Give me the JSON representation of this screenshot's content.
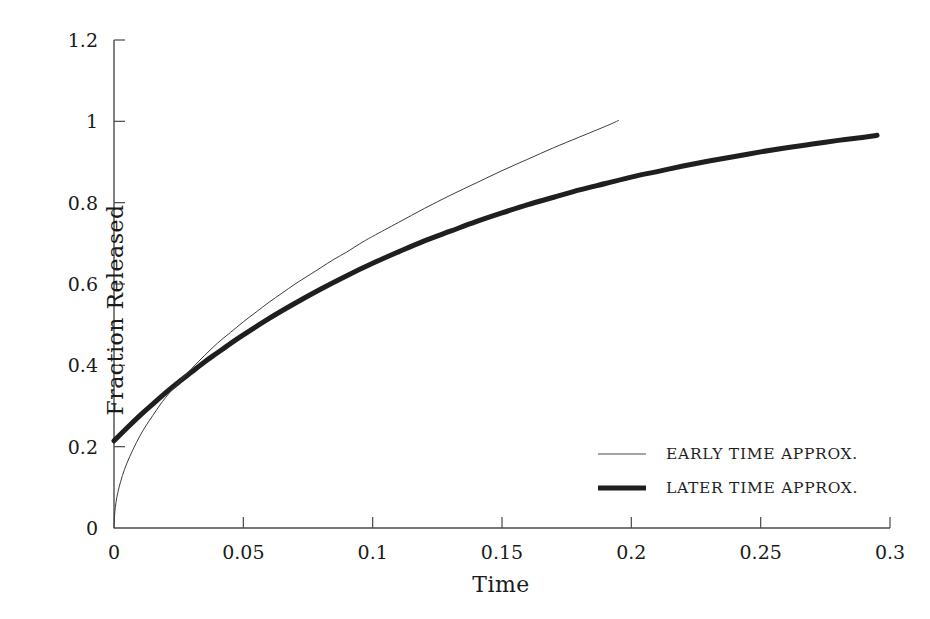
{
  "chart_data": {
    "type": "line",
    "title": "",
    "xlabel": "Time",
    "ylabel": "Fraction Released",
    "xlim": [
      0,
      0.3
    ],
    "ylim": [
      0,
      1.2
    ],
    "grid": false,
    "legend_position": "center-right",
    "x_ticks": [
      "0",
      "0.05",
      "0.1",
      "0.15",
      "0.2",
      "0.25",
      "0.3"
    ],
    "x_tick_values": [
      0,
      0.05,
      0.1,
      0.15,
      0.2,
      0.25,
      0.3
    ],
    "y_ticks": [
      "0",
      "0.2",
      "0.4",
      "0.6",
      "0.8",
      "1",
      "1.2"
    ],
    "y_tick_values": [
      0,
      0.2,
      0.4,
      0.6,
      0.8,
      1,
      1.2
    ],
    "series": [
      {
        "name": "EARLY TIME APPROX.",
        "style": "thin",
        "color": "#3c3c3c",
        "linewidth": 1,
        "x": [
          0.0,
          0.0005,
          0.002,
          0.005,
          0.01,
          0.015,
          0.02,
          0.025,
          0.03,
          0.035,
          0.04,
          0.045,
          0.05,
          0.055,
          0.06,
          0.065,
          0.07,
          0.075,
          0.08,
          0.085,
          0.09,
          0.095,
          0.1,
          0.11,
          0.12,
          0.13,
          0.14,
          0.15,
          0.16,
          0.17,
          0.18,
          0.19,
          0.195
        ],
        "y": [
          0.0,
          0.025,
          0.05,
          0.079,
          0.112,
          0.137,
          0.159,
          0.177,
          0.194,
          0.21,
          0.225,
          0.238,
          0.251,
          0.263,
          0.275,
          0.286,
          0.297,
          0.307,
          0.317,
          0.327,
          0.336,
          0.346,
          0.355,
          0.372,
          0.389,
          0.405,
          0.42,
          0.435,
          0.449,
          0.463,
          0.476,
          0.489,
          0.496
        ]
      },
      {
        "name": "LATER TIME APPROX.",
        "style": "thick",
        "color": "#1f1f1f",
        "linewidth": 5,
        "x": [
          0.0,
          0.005,
          0.01,
          0.015,
          0.02,
          0.025,
          0.03,
          0.035,
          0.04,
          0.045,
          0.05,
          0.06,
          0.07,
          0.08,
          0.09,
          0.1,
          0.11,
          0.12,
          0.13,
          0.14,
          0.15,
          0.16,
          0.17,
          0.18,
          0.19,
          0.2,
          0.21,
          0.22,
          0.23,
          0.24,
          0.25,
          0.26,
          0.27,
          0.28,
          0.29,
          0.295
        ],
        "y": [
          0.19,
          0.218,
          0.245,
          0.27,
          0.295,
          0.318,
          0.34,
          0.362,
          0.382,
          0.402,
          0.421,
          0.457,
          0.49,
          0.521,
          0.55,
          0.577,
          0.602,
          0.626,
          0.647,
          0.668,
          0.687,
          0.705,
          0.721,
          0.737,
          0.751,
          0.765,
          0.777,
          0.789,
          0.8,
          0.81,
          0.82,
          0.829,
          0.837,
          0.845,
          0.852,
          0.856
        ]
      }
    ],
    "note_early_scale_factor": 2.02,
    "note_early_y_display": "thin curve rendered as 2.02*sqrt_like(t) reaching 1.0 at t=0.195",
    "note_later_y_display": "thick curve rendered as saturating exponential reaching 0.965 at t=0.295"
  },
  "axis": {
    "y_title": "Fraction Released",
    "x_title": "Time"
  },
  "legend": {
    "items": [
      {
        "label": "EARLY TIME APPROX.",
        "style": "thin"
      },
      {
        "label": "LATER TIME APPROX.",
        "style": "thick"
      }
    ]
  },
  "colors": {
    "axis": "#4a4a4a",
    "early_curve": "#3c3c3c",
    "later_curve": "#1f1f1f",
    "text": "#1a1a1a",
    "background": "#ffffff"
  }
}
